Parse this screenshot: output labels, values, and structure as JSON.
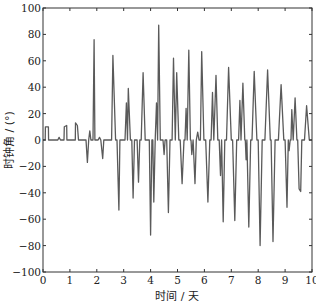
{
  "chart_data": {
    "type": "line",
    "title": "",
    "xlabel": "时间 / 天",
    "ylabel": "时钟角 / (°)",
    "xlim": [
      0,
      10
    ],
    "ylim": [
      -100,
      100
    ],
    "xticks": [
      0,
      1,
      2,
      3,
      4,
      5,
      6,
      7,
      8,
      9,
      10
    ],
    "yticks": [
      -100,
      -80,
      -60,
      -40,
      -20,
      0,
      20,
      40,
      60,
      80,
      100
    ],
    "grid": false,
    "legend": null,
    "line_color": "#5a5a5a",
    "series": [
      {
        "name": "时钟角",
        "points": [
          [
            0.0,
            0
          ],
          [
            0.08,
            0
          ],
          [
            0.09,
            10
          ],
          [
            0.2,
            10
          ],
          [
            0.21,
            0
          ],
          [
            0.55,
            0
          ],
          [
            0.6,
            2
          ],
          [
            0.65,
            0
          ],
          [
            0.78,
            0
          ],
          [
            0.79,
            10
          ],
          [
            0.88,
            11
          ],
          [
            0.89,
            0
          ],
          [
            1.2,
            0
          ],
          [
            1.21,
            13
          ],
          [
            1.28,
            11
          ],
          [
            1.32,
            0
          ],
          [
            1.6,
            0
          ],
          [
            1.65,
            -17
          ],
          [
            1.7,
            0
          ],
          [
            1.74,
            7
          ],
          [
            1.78,
            0
          ],
          [
            1.86,
            0
          ],
          [
            1.9,
            76
          ],
          [
            1.93,
            0
          ],
          [
            2.05,
            0
          ],
          [
            2.1,
            2
          ],
          [
            2.15,
            0
          ],
          [
            2.22,
            -14
          ],
          [
            2.26,
            0
          ],
          [
            2.55,
            0
          ],
          [
            2.6,
            64
          ],
          [
            2.7,
            0
          ],
          [
            2.75,
            0
          ],
          [
            2.82,
            -53
          ],
          [
            2.86,
            0
          ],
          [
            3.05,
            0
          ],
          [
            3.1,
            28
          ],
          [
            3.14,
            0
          ],
          [
            3.17,
            39
          ],
          [
            3.25,
            0
          ],
          [
            3.3,
            0
          ],
          [
            3.35,
            -44
          ],
          [
            3.4,
            0
          ],
          [
            3.5,
            0
          ],
          [
            3.55,
            -32
          ],
          [
            3.6,
            0
          ],
          [
            3.65,
            0
          ],
          [
            3.72,
            51
          ],
          [
            3.8,
            0
          ],
          [
            3.95,
            0
          ],
          [
            4.0,
            -72
          ],
          [
            4.05,
            0
          ],
          [
            4.08,
            0
          ],
          [
            4.12,
            -47
          ],
          [
            4.17,
            0
          ],
          [
            4.22,
            28
          ],
          [
            4.26,
            0
          ],
          [
            4.3,
            87
          ],
          [
            4.36,
            0
          ],
          [
            4.46,
            0
          ],
          [
            4.5,
            -11
          ],
          [
            4.54,
            0
          ],
          [
            4.6,
            0
          ],
          [
            4.66,
            -55
          ],
          [
            4.72,
            0
          ],
          [
            4.8,
            0
          ],
          [
            4.85,
            62
          ],
          [
            4.92,
            0
          ],
          [
            4.97,
            51
          ],
          [
            5.05,
            0
          ],
          [
            5.1,
            0
          ],
          [
            5.17,
            -33
          ],
          [
            5.24,
            0
          ],
          [
            5.28,
            0
          ],
          [
            5.32,
            24
          ],
          [
            5.36,
            0
          ],
          [
            5.42,
            68
          ],
          [
            5.48,
            0
          ],
          [
            5.5,
            0
          ],
          [
            5.53,
            -11
          ],
          [
            5.58,
            0
          ],
          [
            5.65,
            -33
          ],
          [
            5.7,
            0
          ],
          [
            5.75,
            6
          ],
          [
            5.8,
            0
          ],
          [
            5.85,
            0
          ],
          [
            5.9,
            67
          ],
          [
            5.98,
            0
          ],
          [
            6.05,
            0
          ],
          [
            6.13,
            -47
          ],
          [
            6.2,
            0
          ],
          [
            6.25,
            0
          ],
          [
            6.3,
            36
          ],
          [
            6.35,
            0
          ],
          [
            6.43,
            49
          ],
          [
            6.5,
            0
          ],
          [
            6.55,
            0
          ],
          [
            6.6,
            -27
          ],
          [
            6.64,
            0
          ],
          [
            6.7,
            -62
          ],
          [
            6.76,
            0
          ],
          [
            6.82,
            0
          ],
          [
            6.9,
            55
          ],
          [
            7.0,
            0
          ],
          [
            7.05,
            0
          ],
          [
            7.13,
            -61
          ],
          [
            7.2,
            0
          ],
          [
            7.27,
            0
          ],
          [
            7.32,
            30
          ],
          [
            7.36,
            0
          ],
          [
            7.43,
            43
          ],
          [
            7.5,
            0
          ],
          [
            7.52,
            0
          ],
          [
            7.55,
            -15
          ],
          [
            7.58,
            0
          ],
          [
            7.65,
            -66
          ],
          [
            7.72,
            0
          ],
          [
            7.77,
            0
          ],
          [
            7.85,
            52
          ],
          [
            7.95,
            0
          ],
          [
            8.0,
            0
          ],
          [
            8.07,
            -80
          ],
          [
            8.15,
            0
          ],
          [
            8.25,
            0
          ],
          [
            8.35,
            53
          ],
          [
            8.45,
            0
          ],
          [
            8.48,
            0
          ],
          [
            8.55,
            -77
          ],
          [
            8.63,
            0
          ],
          [
            8.75,
            0
          ],
          [
            8.85,
            42
          ],
          [
            8.95,
            0
          ],
          [
            9.0,
            0
          ],
          [
            9.07,
            -51
          ],
          [
            9.12,
            0
          ],
          [
            9.15,
            -8
          ],
          [
            9.19,
            0
          ],
          [
            9.22,
            0
          ],
          [
            9.25,
            23
          ],
          [
            9.3,
            0
          ],
          [
            9.37,
            32
          ],
          [
            9.44,
            0
          ],
          [
            9.47,
            0
          ],
          [
            9.52,
            -37
          ],
          [
            9.58,
            -39
          ],
          [
            9.62,
            0
          ],
          [
            9.72,
            0
          ],
          [
            9.8,
            26
          ],
          [
            9.9,
            0
          ],
          [
            10.0,
            0
          ]
        ]
      }
    ]
  },
  "axes": {
    "xlabel": "时间 / 天",
    "ylabel": "时钟角 / (°)",
    "xtick_labels": [
      "0",
      "1",
      "2",
      "3",
      "4",
      "5",
      "6",
      "7",
      "8",
      "9",
      "10"
    ],
    "ytick_labels": [
      "−100",
      "−80",
      "−60",
      "−40",
      "−20",
      "0",
      "20",
      "40",
      "60",
      "80",
      "100"
    ]
  }
}
